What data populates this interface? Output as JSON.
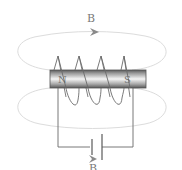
{
  "diagram": {
    "type": "electromagnet",
    "labels": {
      "field_top": "B",
      "field_bottom": "B",
      "pole_left": "N",
      "pole_right": "S"
    },
    "components": [
      {
        "name": "iron-core",
        "shape": "cylinder-bar"
      },
      {
        "name": "coil",
        "turns": 4
      },
      {
        "name": "battery",
        "symbol": "cell"
      },
      {
        "name": "field-line-top",
        "direction": "right"
      },
      {
        "name": "field-line-bottom",
        "direction": "right"
      }
    ],
    "colors": {
      "field_line": "#d8d8d8",
      "wire": "#6a6a6a",
      "core_dark": "#5c5c5c",
      "core_light": "#f2f2f2",
      "label": "#7a7a7a"
    }
  }
}
